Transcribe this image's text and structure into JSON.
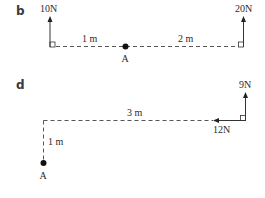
{
  "panels": [
    {
      "id": "b",
      "label": "b",
      "point": "A",
      "forces": [
        {
          "label": "10N",
          "direction": "up",
          "magnitude_N": 10
        },
        {
          "label": "20N",
          "direction": "up",
          "magnitude_N": 20
        }
      ],
      "distances": [
        {
          "label": "1 m",
          "from": "10N force",
          "to": "A"
        },
        {
          "label": "2 m",
          "from": "A",
          "to": "20N force"
        }
      ]
    },
    {
      "id": "d",
      "label": "d",
      "point": "A",
      "forces": [
        {
          "label": "9N",
          "direction": "up",
          "magnitude_N": 9
        },
        {
          "label": "12N",
          "direction": "left",
          "magnitude_N": 12
        }
      ],
      "distances": [
        {
          "label": "3 m",
          "orientation": "horizontal"
        },
        {
          "label": "1 m",
          "orientation": "vertical"
        }
      ]
    }
  ],
  "icons": {
    "arrowhead": "arrowhead-icon",
    "right_angle": "right-angle-marker-icon",
    "pivot_point": "pivot-point-icon"
  }
}
